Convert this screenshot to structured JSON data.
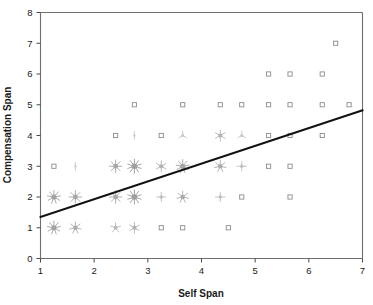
{
  "chart_data": {
    "type": "scatter",
    "title": "",
    "subtitle": "",
    "xlabel": "Self Span",
    "ylabel": "Compensation Span",
    "xlim": [
      1,
      7
    ],
    "ylim": [
      0,
      8
    ],
    "xticks": [
      1,
      2,
      3,
      4,
      5,
      6,
      7
    ],
    "yticks": [
      0,
      1,
      2,
      3,
      4,
      5,
      6,
      7,
      8
    ],
    "xtick_labels": [
      "1",
      "2",
      "3",
      "4",
      "5",
      "6",
      "7"
    ],
    "ytick_labels": [
      "0",
      "1",
      "2",
      "3",
      "4",
      "5",
      "6",
      "7",
      "8"
    ],
    "grid": false,
    "legend": null,
    "marker_style": "sunflower",
    "marker_note": "Open square = 1 observation; petal count indicates number of overlapping observations at that coordinate",
    "annotations": [],
    "points": [
      {
        "x": 1.25,
        "y": 1,
        "count": 9
      },
      {
        "x": 1.65,
        "y": 1,
        "count": 7
      },
      {
        "x": 2.4,
        "y": 1,
        "count": 5
      },
      {
        "x": 2.75,
        "y": 1,
        "count": 6
      },
      {
        "x": 3.25,
        "y": 1,
        "count": 1
      },
      {
        "x": 3.65,
        "y": 1,
        "count": 1
      },
      {
        "x": 4.5,
        "y": 1,
        "count": 1
      },
      {
        "x": 1.25,
        "y": 2,
        "count": 9
      },
      {
        "x": 1.65,
        "y": 2,
        "count": 8
      },
      {
        "x": 2.4,
        "y": 2,
        "count": 8
      },
      {
        "x": 2.75,
        "y": 2,
        "count": 10
      },
      {
        "x": 3.25,
        "y": 2,
        "count": 4
      },
      {
        "x": 3.65,
        "y": 2,
        "count": 7
      },
      {
        "x": 4.35,
        "y": 2,
        "count": 4
      },
      {
        "x": 4.75,
        "y": 2,
        "count": 1
      },
      {
        "x": 5.65,
        "y": 2,
        "count": 1
      },
      {
        "x": 1.25,
        "y": 3,
        "count": 1
      },
      {
        "x": 1.65,
        "y": 3,
        "count": 2
      },
      {
        "x": 2.4,
        "y": 3,
        "count": 8
      },
      {
        "x": 2.75,
        "y": 3,
        "count": 10
      },
      {
        "x": 3.25,
        "y": 3,
        "count": 6
      },
      {
        "x": 3.65,
        "y": 3,
        "count": 9
      },
      {
        "x": 4.35,
        "y": 3,
        "count": 7
      },
      {
        "x": 4.75,
        "y": 3,
        "count": 4
      },
      {
        "x": 5.25,
        "y": 3,
        "count": 1
      },
      {
        "x": 5.65,
        "y": 3,
        "count": 1
      },
      {
        "x": 2.4,
        "y": 4,
        "count": 1
      },
      {
        "x": 2.75,
        "y": 4,
        "count": 2
      },
      {
        "x": 3.25,
        "y": 4,
        "count": 1
      },
      {
        "x": 3.65,
        "y": 4,
        "count": 3
      },
      {
        "x": 4.35,
        "y": 4,
        "count": 6
      },
      {
        "x": 4.75,
        "y": 4,
        "count": 3
      },
      {
        "x": 5.25,
        "y": 4,
        "count": 1
      },
      {
        "x": 5.65,
        "y": 4,
        "count": 1
      },
      {
        "x": 6.25,
        "y": 4,
        "count": 1
      },
      {
        "x": 2.75,
        "y": 5,
        "count": 1
      },
      {
        "x": 3.65,
        "y": 5,
        "count": 1
      },
      {
        "x": 4.35,
        "y": 5,
        "count": 1
      },
      {
        "x": 4.75,
        "y": 5,
        "count": 1
      },
      {
        "x": 5.25,
        "y": 5,
        "count": 1
      },
      {
        "x": 5.65,
        "y": 5,
        "count": 1
      },
      {
        "x": 6.25,
        "y": 5,
        "count": 1
      },
      {
        "x": 6.75,
        "y": 5,
        "count": 1
      },
      {
        "x": 5.25,
        "y": 6,
        "count": 1
      },
      {
        "x": 5.65,
        "y": 6,
        "count": 1
      },
      {
        "x": 6.25,
        "y": 6,
        "count": 1
      },
      {
        "x": 6.5,
        "y": 7,
        "count": 1
      }
    ],
    "trendline": {
      "type": "linear-regression",
      "x_start": 1,
      "y_start": 1.35,
      "x_end": 7,
      "y_end": 4.82,
      "color": "#111111"
    }
  },
  "colors": {
    "background": "#ffffff",
    "axis": "#6f6f6f",
    "text": "#1a1a1a",
    "marker": "#8c8c8c",
    "trendline": "#111111"
  }
}
